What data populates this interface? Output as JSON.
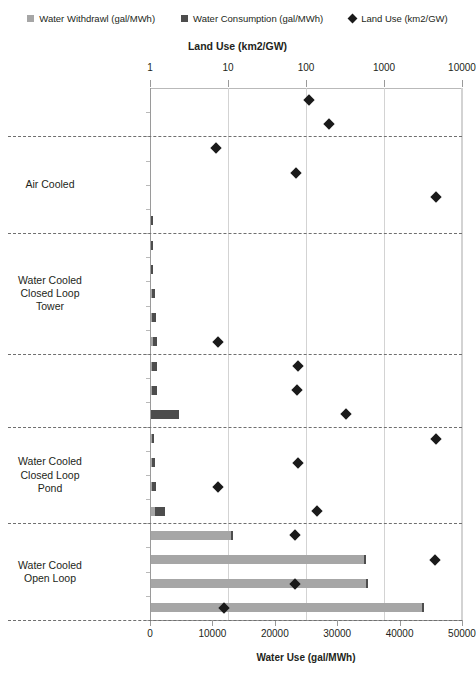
{
  "legend": [
    {
      "label": "Water Withdrawl (gal/MWh)",
      "marker": "square-icon",
      "color": "#a6a6a6"
    },
    {
      "label": "Water Consumption (gal/MWh)",
      "marker": "square-icon",
      "color": "#4d4d4d"
    },
    {
      "label": "Land Use (km2/GW)",
      "marker": "diamond-icon",
      "color": "#1a1a1a"
    }
  ],
  "chart_data": {
    "type": "bar",
    "title": "",
    "top_axis": {
      "label": "Land Use (km2/GW)",
      "scale": "log",
      "ticks": [
        1,
        10,
        100,
        1000,
        10000
      ],
      "ticklabels": [
        "1",
        "10",
        "100",
        "1000",
        "10000"
      ],
      "range": [
        1,
        10000
      ]
    },
    "bottom_axis": {
      "label": "Water Use (gal/MWh)",
      "scale": "linear",
      "ticks": [
        0,
        10000,
        20000,
        30000,
        40000,
        50000
      ],
      "ticklabels": [
        "0",
        "10000",
        "20000",
        "30000",
        "40000",
        "50000"
      ],
      "range": [
        0,
        50000
      ]
    },
    "grid": "vertical",
    "legend_position": "top",
    "series": [
      {
        "name": "Water Withdrawl (gal/MWh)",
        "axis": "bottom",
        "color": "#a6a6a6"
      },
      {
        "name": "Water Consumption (gal/MWh)",
        "axis": "bottom",
        "color": "#4d4d4d"
      },
      {
        "name": "Land Use (km2/GW)",
        "axis": "top",
        "color": "#1a1a1a",
        "marker": "diamond"
      }
    ],
    "groups": [
      {
        "label": "",
        "rows": [
          0,
          1
        ]
      },
      {
        "label": "Air Cooled",
        "rows": [
          2,
          3,
          4,
          5
        ]
      },
      {
        "label": "Water Cooled\nClosed Loop\nTower",
        "rows": [
          6,
          7,
          8,
          9,
          10
        ]
      },
      {
        "label": "",
        "rows": [
          11,
          12,
          13
        ]
      },
      {
        "label": "Water Cooled\nClosed Loop\nPond",
        "rows": [
          14,
          15,
          16,
          17
        ]
      },
      {
        "label": "Water Cooled\nOpen Loop",
        "rows": [
          18,
          19,
          20
        ]
      }
    ],
    "categories": [
      "Solar PV",
      "Wind",
      "Nuclear",
      "Natural Gas",
      "Biomass",
      "Coal",
      "Coal IGCC",
      "Natural Gas",
      "Biomass",
      "Coal",
      "Nuclear",
      "Solar Tower",
      "Solar Trough",
      "Hydroelectric",
      "Biomass",
      "Coal",
      "Nuclear",
      "Geothermal",
      "Natural Gas",
      "Biomass",
      "Coal",
      "Nuclear"
    ],
    "rows": [
      {
        "category": "Solar PV",
        "withdrawal": 0,
        "consumption": 0,
        "land_use": 110
      },
      {
        "category": "Wind",
        "withdrawal": 0,
        "consumption": 0,
        "land_use": 200
      },
      {
        "category": "Nuclear",
        "withdrawal": 0,
        "consumption": 0,
        "land_use": 7
      },
      {
        "category": "Natural Gas",
        "withdrawal": 0,
        "consumption": 0,
        "land_use": 75
      },
      {
        "category": "Biomass",
        "withdrawal": 0,
        "consumption": 0,
        "land_use": 4600
      },
      {
        "category": "Coal",
        "withdrawal": 60,
        "consumption": 60,
        "land_use": null
      },
      {
        "category": "Coal IGCC",
        "withdrawal": 180,
        "consumption": 140,
        "land_use": null
      },
      {
        "category": "Natural Gas",
        "withdrawal": 200,
        "consumption": 160,
        "land_use": null
      },
      {
        "category": "Biomass",
        "withdrawal": 600,
        "consumption": 500,
        "land_use": null
      },
      {
        "category": "Coal",
        "withdrawal": 750,
        "consumption": 600,
        "land_use": null
      },
      {
        "category": "Nuclear",
        "withdrawal": 950,
        "consumption": 700,
        "land_use": 7.5
      },
      {
        "category": "Solar Tower",
        "withdrawal": 900,
        "consumption": 750,
        "land_use": 78
      },
      {
        "category": "Solar Trough",
        "withdrawal": 900,
        "consumption": 800,
        "land_use": 77
      },
      {
        "category": "Hydroelectric",
        "withdrawal": 4500,
        "consumption": 4500,
        "land_use": 330
      },
      {
        "category": "Biomass",
        "withdrawal": 480,
        "consumption": 380,
        "land_use": 4700
      },
      {
        "category": "Coal",
        "withdrawal": 700,
        "consumption": 600,
        "land_use": 80
      },
      {
        "category": "Nuclear",
        "withdrawal": 800,
        "consumption": 700,
        "land_use": 7.4
      },
      {
        "category": "Geothermal",
        "withdrawal": 2200,
        "consumption": 1500,
        "land_use": 140
      },
      {
        "category": "Natural Gas",
        "withdrawal": 13200,
        "consumption": 200,
        "land_use": 73
      },
      {
        "category": "Biomass",
        "withdrawal": 34500,
        "consumption": 400,
        "land_use": 4500
      },
      {
        "category": "Coal",
        "withdrawal": 34800,
        "consumption": 400,
        "land_use": 72
      },
      {
        "category": "Nuclear",
        "withdrawal": 43800,
        "consumption": 400,
        "land_use": 9
      }
    ]
  }
}
